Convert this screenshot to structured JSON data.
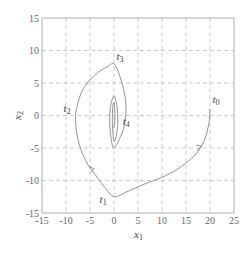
{
  "chart_data": {
    "type": "line",
    "title": "",
    "xlabel": "x1",
    "ylabel": "x2",
    "xlim": [
      -15,
      25
    ],
    "ylim": [
      -15,
      15
    ],
    "grid": true,
    "legend": "none",
    "x_ticks": [
      -15,
      -10,
      -5,
      0,
      5,
      10,
      15,
      20,
      25
    ],
    "y_ticks": [
      -15,
      -10,
      -5,
      0,
      5,
      10,
      15
    ],
    "x_tick_labels": [
      "-15",
      "-10",
      "-5",
      "0",
      "5",
      "10",
      "15",
      "20",
      "25"
    ],
    "y_tick_labels": [
      "-15",
      "-10",
      "-5",
      "0",
      "5",
      "10",
      "15"
    ],
    "series": [
      {
        "name": "trajectory",
        "color": "#888888",
        "points": [
          [
            20,
            1
          ],
          [
            19.8,
            -1
          ],
          [
            19,
            -3.5
          ],
          [
            17.5,
            -5.5
          ],
          [
            15.5,
            -7
          ],
          [
            12.5,
            -8.6
          ],
          [
            9,
            -9.8
          ],
          [
            5.5,
            -10.8
          ],
          [
            2.5,
            -11.8
          ],
          [
            0,
            -12.5
          ],
          [
            -2,
            -11
          ],
          [
            -4,
            -9
          ],
          [
            -5.5,
            -7.5
          ],
          [
            -7,
            -5
          ],
          [
            -7.8,
            -2.5
          ],
          [
            -8,
            0
          ],
          [
            -7.5,
            2
          ],
          [
            -6.5,
            4
          ],
          [
            -5,
            5.5
          ],
          [
            -3,
            6.8
          ],
          [
            -1,
            7.7
          ],
          [
            0,
            8
          ],
          [
            1,
            6.5
          ],
          [
            2,
            4
          ],
          [
            2.5,
            1.5
          ],
          [
            2.3,
            -1
          ],
          [
            1.5,
            -3
          ],
          [
            0,
            -5
          ],
          [
            -0.6,
            -3.5
          ],
          [
            -0.9,
            -1
          ],
          [
            -0.7,
            1.5
          ],
          [
            0,
            3
          ],
          [
            0.6,
            1.5
          ],
          [
            0.8,
            -1
          ],
          [
            0.5,
            -3
          ],
          [
            0,
            -4
          ],
          [
            -0.3,
            -2
          ],
          [
            -0.3,
            1
          ],
          [
            0,
            2
          ],
          [
            0.2,
            0
          ],
          [
            0,
            -2
          ]
        ]
      }
    ],
    "annotations": [
      {
        "text": "t0",
        "x": 20.5,
        "y": 2
      },
      {
        "text": "t1",
        "x": -3,
        "y": -13.5
      },
      {
        "text": "t2",
        "x": -10.5,
        "y": 0.5
      },
      {
        "text": "t3",
        "x": 0.5,
        "y": 8.5
      },
      {
        "text": "t4",
        "x": 1.8,
        "y": -1.5
      }
    ],
    "arrows": [
      {
        "at": [
          18,
          -5
        ],
        "direction": "down-left"
      },
      {
        "at": [
          -4.5,
          -8.5
        ],
        "direction": "up-left"
      }
    ]
  },
  "labels": {
    "xlabel_main": "x",
    "xlabel_sub": "1",
    "ylabel_main": "x",
    "ylabel_sub": "2",
    "t0_main": "t",
    "t0_sub": "0",
    "t1_main": "t",
    "t1_sub": "1",
    "t2_main": "t",
    "t2_sub": "2",
    "t3_main": "t",
    "t3_sub": "3",
    "t4_main": "t",
    "t4_sub": "4"
  }
}
